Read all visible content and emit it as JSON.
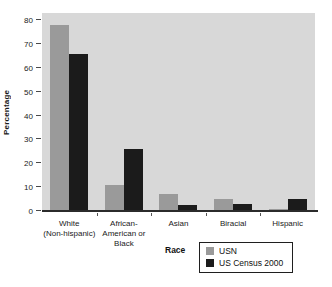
{
  "chart_data": {
    "type": "bar",
    "title": "",
    "categories": [
      "White (Non-hispanic)",
      "African-American or Black",
      "Asian",
      "Biracial",
      "Hispanic"
    ],
    "category_label_lines": [
      [
        "White",
        "(Non-hispanic)"
      ],
      [
        "African-",
        "American or",
        "Black"
      ],
      [
        "Asian"
      ],
      [
        "Biracial"
      ],
      [
        "Hispanic"
      ]
    ],
    "series": [
      {
        "name": "USN",
        "color": "#9a9a9a",
        "values": [
          78,
          11,
          7,
          5,
          1
        ]
      },
      {
        "name": "US Census 2000",
        "color": "#1b1b1b",
        "values": [
          66,
          26,
          2.5,
          3,
          5
        ]
      }
    ],
    "xlabel": "Race",
    "ylabel": "Percentage",
    "ylim": [
      0,
      83
    ],
    "yticks": [
      0,
      10,
      20,
      30,
      40,
      50,
      60,
      70,
      80
    ],
    "grid": false,
    "legend_position": "bottom-right",
    "plot_background": "#d8d8d8"
  }
}
